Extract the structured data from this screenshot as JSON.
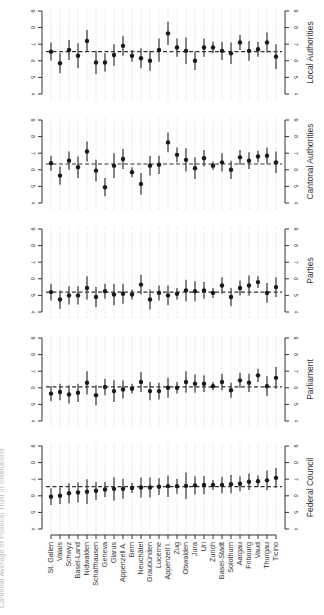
{
  "figure": {
    "caption": "Cantonal Average of Political Trust in Institutions",
    "orientation": "rotated 90 degrees; canton labels along bottom, panels stacked vertically",
    "colors": {
      "point": "#1a1a1a",
      "ci": "#444444",
      "mean_line": "#333333",
      "grid": "#c8c8c8",
      "axis": "#333333",
      "text": "#333333"
    }
  },
  "chart_data": {
    "type": "scatter",
    "subtype": "dot-and-whisker (point estimates with confidence intervals), one panel per institution",
    "title": "",
    "xlabel": "",
    "ylabel": "",
    "ylim": [
      4,
      9
    ],
    "yticks": [
      4,
      5,
      6,
      7,
      8,
      9
    ],
    "grid": "vertical dotted lines at each canton",
    "legend": "none",
    "categories": [
      "St. Gallen",
      "Valais",
      "Schwyz",
      "Basel-Land",
      "Nidwalden",
      "Schaffhausen",
      "Geneva",
      "Glarus",
      "Appenzell A.",
      "Bern",
      "Neuchâtel",
      "Graubünden",
      "Lucerne",
      "Appenzell I.",
      "Zug",
      "Obwalden",
      "Jura",
      "Uri",
      "Zurich",
      "Basel-Stadt",
      "Solothurn",
      "Aargau",
      "Fribourg",
      "Vaud",
      "Thurgau",
      "Ticino"
    ],
    "series": [
      {
        "name": "Local Authorities",
        "mean_line": 6.55,
        "values": [
          6.55,
          5.85,
          6.65,
          6.3,
          7.2,
          5.9,
          5.9,
          6.35,
          6.9,
          6.3,
          6.15,
          6.0,
          6.65,
          7.65,
          6.8,
          6.6,
          6.0,
          6.8,
          6.8,
          6.6,
          6.45,
          7.1,
          6.6,
          6.7,
          7.1,
          6.25
        ],
        "ci_halfwidth": [
          0.55,
          0.6,
          0.6,
          0.75,
          0.65,
          0.7,
          0.55,
          0.65,
          0.6,
          0.35,
          0.6,
          0.6,
          0.7,
          0.7,
          0.55,
          0.8,
          0.55,
          0.55,
          0.35,
          0.55,
          0.65,
          0.45,
          0.6,
          0.45,
          0.6,
          0.75
        ]
      },
      {
        "name": "Cantonal Authorities",
        "mean_line": 6.35,
        "values": [
          6.4,
          5.65,
          6.55,
          6.15,
          7.1,
          5.95,
          4.95,
          6.25,
          6.65,
          5.85,
          5.15,
          6.25,
          6.3,
          7.65,
          6.9,
          6.6,
          6.1,
          6.7,
          6.25,
          6.45,
          6.0,
          6.75,
          6.55,
          6.8,
          6.85,
          6.45
        ],
        "ci_halfwidth": [
          0.45,
          0.55,
          0.55,
          0.65,
          0.6,
          0.65,
          0.55,
          0.75,
          0.6,
          0.3,
          0.65,
          0.6,
          0.55,
          0.6,
          0.45,
          0.7,
          0.65,
          0.5,
          0.25,
          0.55,
          0.55,
          0.45,
          0.5,
          0.35,
          0.5,
          0.65
        ]
      },
      {
        "name": "Parties",
        "mean_line": 5.2,
        "values": [
          5.2,
          4.75,
          5.0,
          5.0,
          5.45,
          4.9,
          5.25,
          5.05,
          5.1,
          5.05,
          5.65,
          4.75,
          5.15,
          5.0,
          5.1,
          5.3,
          5.25,
          5.3,
          5.15,
          5.6,
          4.9,
          5.45,
          5.6,
          5.8,
          5.15,
          5.5
        ],
        "ci_halfwidth": [
          0.5,
          0.55,
          0.55,
          0.55,
          0.7,
          0.6,
          0.45,
          0.65,
          0.6,
          0.3,
          0.6,
          0.6,
          0.45,
          0.6,
          0.35,
          0.65,
          0.6,
          0.5,
          0.3,
          0.5,
          0.55,
          0.45,
          0.6,
          0.35,
          0.6,
          0.6
        ]
      },
      {
        "name": "Parliament",
        "mean_line": 6.05,
        "values": [
          5.65,
          5.75,
          5.6,
          5.7,
          6.3,
          5.55,
          6.05,
          5.8,
          5.9,
          5.95,
          6.35,
          5.8,
          5.8,
          6.0,
          6.0,
          6.35,
          6.25,
          6.25,
          6.1,
          6.35,
          5.85,
          6.45,
          6.3,
          6.75,
          6.1,
          6.6
        ],
        "ci_halfwidth": [
          0.45,
          0.5,
          0.55,
          0.55,
          0.7,
          0.6,
          0.5,
          0.65,
          0.55,
          0.3,
          0.6,
          0.55,
          0.5,
          0.6,
          0.35,
          0.65,
          0.55,
          0.5,
          0.25,
          0.5,
          0.45,
          0.45,
          0.55,
          0.4,
          0.6,
          0.65
        ]
      },
      {
        "name": "Federal Council",
        "mean_line": 6.55,
        "values": [
          5.95,
          6.0,
          6.15,
          6.2,
          6.25,
          6.3,
          6.38,
          6.42,
          6.42,
          6.47,
          6.5,
          6.5,
          6.55,
          6.58,
          6.58,
          6.6,
          6.63,
          6.65,
          6.65,
          6.65,
          6.7,
          6.73,
          6.85,
          6.88,
          6.93,
          7.08
        ],
        "ci_halfwidth": [
          0.5,
          0.5,
          0.6,
          0.6,
          0.75,
          0.55,
          0.45,
          0.7,
          0.6,
          0.3,
          0.6,
          0.6,
          0.5,
          0.65,
          0.45,
          0.8,
          0.55,
          0.55,
          0.3,
          0.5,
          0.55,
          0.45,
          0.5,
          0.35,
          0.6,
          0.6
        ]
      }
    ]
  },
  "layout": {
    "left_axis_x": 42,
    "right_axis_x": 285,
    "first_x": 51,
    "step_x": 9,
    "panel_top_y": [
      11,
      120,
      229,
      338,
      446
    ],
    "px_per_unit": 16.6,
    "labels_top_y": 540
  }
}
